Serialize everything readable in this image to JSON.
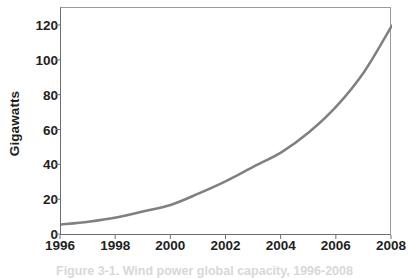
{
  "chart_data": {
    "type": "line",
    "title": "",
    "subtitle": "",
    "xlabel": "",
    "ylabel": "Gigawatts",
    "xlim": [
      1996,
      2008
    ],
    "ylim": [
      0,
      130
    ],
    "y_ticks": [
      0,
      20,
      40,
      60,
      80,
      100,
      120
    ],
    "y_tick_labels": [
      "0",
      "20",
      "40",
      "60",
      "80",
      "100",
      "120"
    ],
    "x_ticks": [
      1996,
      1998,
      2000,
      2002,
      2004,
      2006,
      2008
    ],
    "x_tick_labels": [
      "1996",
      "1998",
      "2000",
      "2002",
      "2004",
      "2006",
      "2008"
    ],
    "grid": false,
    "legend": false,
    "legend_position": "none",
    "series": [
      {
        "name": "Global cumulative installed wind capacity",
        "color": "#808080",
        "line_width": 2.5,
        "x": [
          1996,
          1997,
          1998,
          1999,
          2000,
          2001,
          2002,
          2003,
          2004,
          2005,
          2006,
          2007,
          2008
        ],
        "values": [
          6,
          7.6,
          10,
          13.6,
          17.4,
          23.9,
          31.1,
          39.4,
          47.6,
          59.1,
          74.1,
          93.9,
          120.3
        ]
      }
    ],
    "annotations": []
  },
  "axes": {
    "y_title": "Gigawatts"
  },
  "caption": {
    "text": "Figure 3-1. Wind power global capacity, 1996-2008"
  }
}
